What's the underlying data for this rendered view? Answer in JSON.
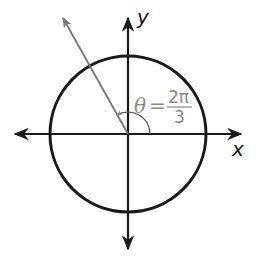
{
  "diagram": {
    "type": "unit-circle-angle",
    "axes": {
      "x_label": "x",
      "y_label": "y"
    },
    "angle": {
      "symbol": "θ",
      "equals": "=",
      "numerator": "2π",
      "denominator": "3",
      "value_radians": "2π/3"
    },
    "colors": {
      "axes": "#1a1a1a",
      "circle": "#1a1a1a",
      "terminal_ray": "#777777",
      "angle_label": "#8a8a8a"
    }
  }
}
